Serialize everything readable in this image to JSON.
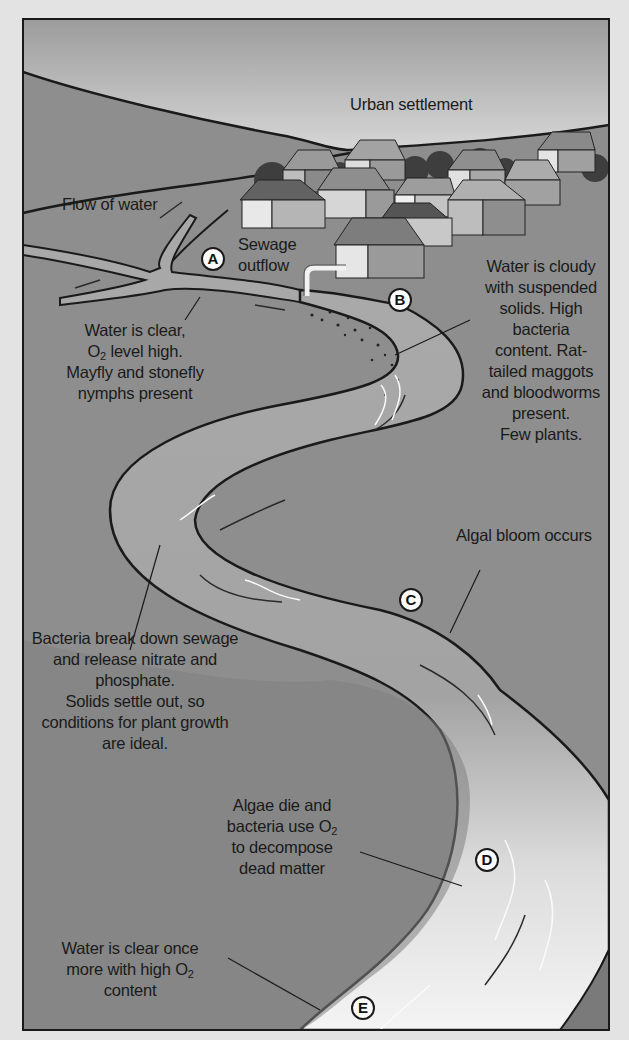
{
  "labels": {
    "urban_settlement": "Urban settlement",
    "flow_of_water": "Flow of water",
    "sewage_outflow": [
      "Sewage",
      "outflow"
    ],
    "point_a": [
      "Water is clear,",
      "O2 level high.",
      "Mayfly and stonefly",
      "nymphs present"
    ],
    "point_b": [
      "Water is cloudy",
      "with suspended",
      "solids. High",
      "bacteria",
      "content. Rat-",
      "tailed maggots",
      "and bloodworms",
      "present.",
      "Few plants."
    ],
    "point_c": [
      "Algal bloom occurs"
    ],
    "bacteria_note": [
      "Bacteria break down sewage",
      "and release nitrate and",
      "phosphate.",
      "Solids settle out, so",
      "conditions for plant growth",
      "are ideal."
    ],
    "point_d": [
      "Algae die and",
      "bacteria use O2",
      "to decompose",
      "dead matter"
    ],
    "point_e": [
      "Water is clear once",
      "more with high O2",
      "content"
    ]
  },
  "markers": {
    "a": "A",
    "b": "B",
    "c": "C",
    "d": "D",
    "e": "E"
  },
  "colors": {
    "sky_top": "#9a9a9a",
    "sky_bottom": "#f4f4f4",
    "land": "#8f8f8f",
    "river_polluted": "#a8a8a8",
    "river_clean": "#f2f2f2",
    "outline": "#1a1a1a"
  }
}
